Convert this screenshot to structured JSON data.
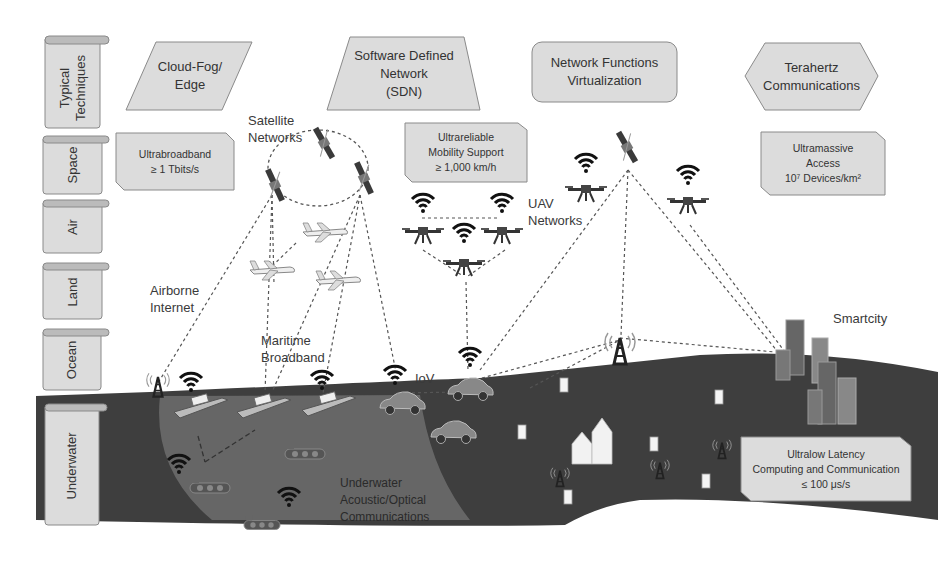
{
  "layers": [
    {
      "id": "techniques",
      "label": "Typical\nTechniques"
    },
    {
      "id": "space",
      "label": "Space"
    },
    {
      "id": "air",
      "label": "Air"
    },
    {
      "id": "land",
      "label": "Land"
    },
    {
      "id": "ocean",
      "label": "Ocean"
    },
    {
      "id": "underwater",
      "label": "Underwater"
    }
  ],
  "techniques": [
    {
      "label": "Cloud-Fog/\nEdge",
      "shape": "parallelogram"
    },
    {
      "label": "Software Defined\nNetwork\n(SDN)",
      "shape": "trapezoid"
    },
    {
      "label": "Network Functions\nVirtualization",
      "shape": "rounded-rect"
    },
    {
      "label": "Terahertz\nCommunications",
      "shape": "hexagon"
    }
  ],
  "kpis": [
    {
      "label": "Ultrabroadband\n≥ 1 Tbits/s"
    },
    {
      "label": "Ultrareliable\nMobility Support\n≥ 1,000 km/h"
    },
    {
      "label": "Ultramassive\nAccess\n10⁷ Devices/km²"
    },
    {
      "label": "Ultralow Latency\nComputing and Communication\n≤ 100 μs/s"
    }
  ],
  "network_labels": {
    "satellite": "Satellite\nNetworks",
    "airborne": "Airborne\nInternet",
    "maritime": "Maritime\nBroadband",
    "uav": "UAV\nNetworks",
    "iov": "IoV",
    "smartcity": "Smartcity",
    "underwater": "Underwater\nAcoustic/Optical\nCommunications"
  },
  "colors": {
    "box_fill": "#dcdcdc",
    "box_stroke": "#8a8a8a",
    "sea": "#3e3e3e",
    "underwater_circle": "#6e6e6e",
    "dash": "#555555"
  }
}
